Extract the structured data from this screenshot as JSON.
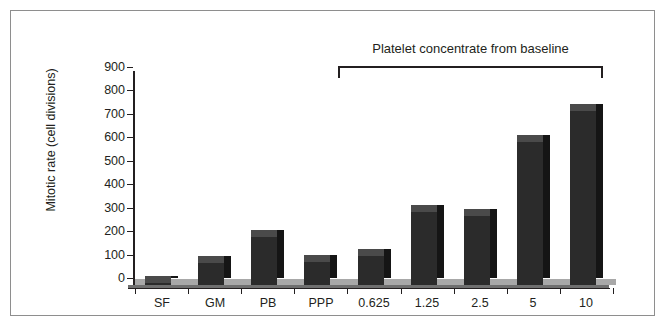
{
  "chart_data": {
    "type": "bar",
    "title": "",
    "xlabel": "",
    "ylabel": "Mitotic rate (cell divisions)",
    "categories": [
      "SF",
      "GM",
      "PB",
      "PPP",
      "0.625",
      "1.25",
      "2.5",
      "5",
      "10"
    ],
    "values": [
      10,
      95,
      205,
      100,
      122,
      310,
      293,
      612,
      742
    ],
    "ylim": [
      0,
      900
    ],
    "yticks": [
      0,
      100,
      200,
      300,
      400,
      500,
      600,
      700,
      800,
      900
    ],
    "ytick_labels": [
      "0",
      "100",
      "200",
      "300",
      "400",
      "500",
      "600",
      "700",
      "800",
      "900"
    ],
    "grid": false,
    "legend": null,
    "annotations": [
      {
        "text": "Platelet concentrate from baseline",
        "type": "group-bracket",
        "covers": [
          "0.625",
          "1.25",
          "2.5",
          "5",
          "10"
        ]
      }
    ],
    "bar_color": "#2b2b2b",
    "bar_top_color": "#4a4a4a",
    "bar_side_color": "#151515",
    "floor_color": "#a8a8a8",
    "axis_color": "#231f20",
    "frame_color": "#8e8e8e",
    "background_color": "#ffffff"
  },
  "axes": {
    "y_title": "Mitotic rate (cell divisions)"
  },
  "bracket": {
    "caption": "Platelet concentrate from baseline"
  }
}
